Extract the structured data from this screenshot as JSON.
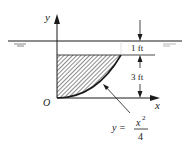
{
  "diagram": {
    "axes": {
      "x_label": "x",
      "y_label": "y",
      "origin_label": "O"
    },
    "dimensions": [
      {
        "label": "1 ft",
        "description": "depth from water surface to top of plate"
      },
      {
        "label": "3 ft",
        "description": "height of plate"
      }
    ],
    "curve": {
      "equation_lhs": "y =",
      "numerator": "x",
      "exponent": "2",
      "denominator": "4"
    },
    "region": "hatched area under top edge, above curve y = x^2/4",
    "colors": {
      "ink": "#1a1a1a",
      "background": "#ffffff"
    }
  }
}
